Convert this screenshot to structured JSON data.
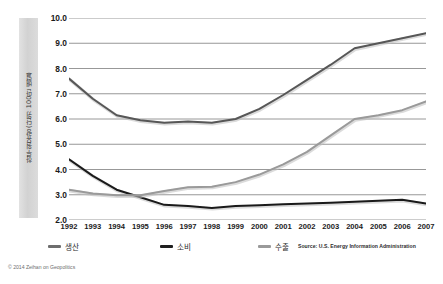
{
  "figure": {
    "background": "#ffffff",
    "ylabel_band_color": "#d8d8d8"
  },
  "axis": {
    "ylabel": "하루 원유량 (단위: 100만 배럴)",
    "yticks": [
      "10.0",
      "9.0",
      "8.0",
      "7.0",
      "6.0",
      "5.0",
      "4.0",
      "3.0",
      "2.0"
    ],
    "xticks": [
      "1992",
      "1993",
      "1994",
      "1995",
      "1996",
      "1997",
      "1998",
      "1999",
      "2000",
      "2001",
      "2002",
      "2003",
      "2004",
      "2005",
      "2006",
      "2007"
    ]
  },
  "legend": {
    "items": [
      {
        "label": "생산",
        "color": "#6e6e6e"
      },
      {
        "label": "소비",
        "color": "#1f1f1f"
      },
      {
        "label": "수출",
        "color": "#9a9a9a"
      }
    ]
  },
  "source_note": "Source: U.S. Energy Information Administration",
  "credit": "© 2014 Zeihan on Geopolitics",
  "chart_data": {
    "type": "line",
    "title": "",
    "subtitle": "",
    "xlabel": "",
    "ylabel": "하루 원유량 (단위: 100만 배럴)",
    "x": [
      1992,
      1993,
      1994,
      1995,
      1996,
      1997,
      1998,
      1999,
      2000,
      2001,
      2002,
      2003,
      2004,
      2005,
      2006,
      2007
    ],
    "xlim": [
      1992,
      2007
    ],
    "ylim": [
      2.0,
      10.0
    ],
    "ytick_step": 1.0,
    "grid": true,
    "grid_axis": "y",
    "grid_color": "#8c8c8c",
    "legend_position": "bottom",
    "series": [
      {
        "name": "생산",
        "color": "#575757",
        "width": 2.0,
        "values": [
          7.6,
          6.8,
          6.15,
          5.95,
          5.85,
          5.9,
          5.85,
          6.0,
          6.4,
          6.95,
          7.55,
          8.15,
          8.8,
          9.0,
          9.2,
          9.4
        ]
      },
      {
        "name": "소비",
        "color": "#1a1a1a",
        "width": 2.0,
        "values": [
          4.4,
          3.75,
          3.2,
          2.9,
          2.6,
          2.55,
          2.48,
          2.55,
          2.58,
          2.62,
          2.65,
          2.68,
          2.72,
          2.76,
          2.8,
          2.65
        ]
      },
      {
        "name": "수출",
        "color": "#9a9a9a",
        "width": 2.0,
        "values": [
          3.2,
          3.05,
          2.98,
          2.98,
          3.15,
          3.3,
          3.32,
          3.5,
          3.8,
          4.2,
          4.7,
          5.35,
          6.0,
          6.15,
          6.35,
          6.7
        ]
      }
    ]
  }
}
